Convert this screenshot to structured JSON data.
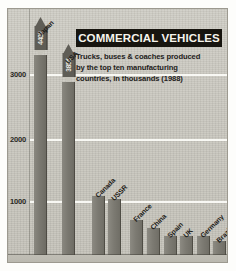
{
  "title": "COMMERCIAL VEHICLES",
  "subtitle_lines": [
    "Trucks, buses & coaches produced",
    "by the top ten manufacturing",
    "countries, in thousands (1988)"
  ],
  "axis": {
    "ticks": [
      "3000",
      "2000",
      "1000"
    ]
  },
  "colors": {
    "background": "#c9c7bf",
    "bar": "#7a7870",
    "bar_head": "#5f5d56",
    "title_banner": "#17150f",
    "title_text": "#f6f4ec",
    "gridline": "#fbfbf7",
    "text": "#23211b"
  },
  "chart_data": {
    "type": "bar",
    "title": "COMMERCIAL VEHICLES",
    "subtitle": "Trucks, buses & coaches produced by the top ten manufacturing countries, in thousands (1988)",
    "xlabel": "",
    "ylabel": "",
    "units": "thousands",
    "year": "1988",
    "ylim": [
      0,
      3300
    ],
    "yticks": [
      1000,
      2000,
      3000
    ],
    "grid": true,
    "legend": false,
    "categories": [
      "Japan",
      "USA",
      "Canada",
      "USSR",
      "France",
      "China",
      "Spain",
      "UK",
      "Germany",
      "Brazil"
    ],
    "values": [
      4488,
      3855,
      950,
      900,
      560,
      430,
      310,
      310,
      310,
      230
    ],
    "value_labels": [
      "4488",
      "3855",
      "",
      "",
      "",
      "",
      "",
      "",
      "",
      ""
    ]
  },
  "bars": [
    {
      "label": "Japan",
      "value": 4488,
      "value_label": "4488",
      "overflow": true,
      "left": 26,
      "width": 13,
      "top": 20
    },
    {
      "label": "USA",
      "value": 3855,
      "value_label": "3855",
      "overflow": true,
      "left": 54,
      "width": 13,
      "top": 47
    },
    {
      "label": "Canada",
      "value": 950,
      "value_label": "",
      "overflow": false,
      "left": 84,
      "width": 13,
      "top": 0
    },
    {
      "label": "USSR",
      "value": 900,
      "value_label": "",
      "overflow": false,
      "left": 100,
      "width": 13,
      "top": 0
    },
    {
      "label": "France",
      "value": 560,
      "value_label": "",
      "overflow": false,
      "left": 122,
      "width": 13,
      "top": 0
    },
    {
      "label": "China",
      "value": 430,
      "value_label": "",
      "overflow": false,
      "left": 139,
      "width": 13,
      "top": 0
    },
    {
      "label": "Spain",
      "value": 310,
      "value_label": "",
      "overflow": false,
      "left": 156,
      "width": 13,
      "top": 0
    },
    {
      "label": "UK",
      "value": 310,
      "value_label": "",
      "overflow": false,
      "left": 172,
      "width": 13,
      "top": 0
    },
    {
      "label": "Germany",
      "value": 310,
      "value_label": "",
      "overflow": false,
      "left": 189,
      "width": 13,
      "top": 0
    },
    {
      "label": "Brazil",
      "value": 230,
      "value_label": "",
      "overflow": false,
      "left": 205,
      "width": 13,
      "top": 0
    }
  ]
}
